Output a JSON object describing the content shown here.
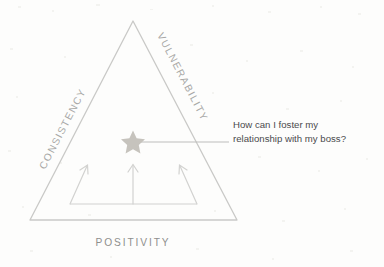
{
  "figure": {
    "title_visible": false,
    "colors": {
      "background": "#fdfdfc",
      "triangle_stroke": "#c9c9c7",
      "arrow_stroke": "#d2d2d0",
      "star_fill": "#c6c3bd",
      "leader_line": "#bdbdbb",
      "edge_label_text": "#a8a8a6",
      "base_label_text": "#8f8f8d",
      "annotation_text": "#4a4a4c"
    },
    "triangle": {
      "apex": [
        133,
        21
      ],
      "bottom_left": [
        30,
        220
      ],
      "bottom_right": [
        237,
        220
      ]
    },
    "labels": {
      "left_edge": "CONSISTENCY",
      "right_edge": "VULNERABILITY",
      "base": "POSITIVITY"
    },
    "marker": {
      "name": "star",
      "points": 5,
      "center": [
        133,
        142
      ]
    },
    "leader_line": {
      "from": [
        140,
        142
      ],
      "to": [
        229,
        142
      ]
    },
    "arrows": [
      {
        "name": "left-arrow",
        "from": [
          70,
          204
        ],
        "to": [
          87,
          166
        ],
        "direction": "up-right"
      },
      {
        "name": "center-arrow",
        "from": [
          133,
          204
        ],
        "to": [
          133,
          165
        ],
        "direction": "up"
      },
      {
        "name": "right-arrow",
        "from": [
          197,
          204
        ],
        "to": [
          180,
          166
        ],
        "direction": "up-left"
      }
    ],
    "arrow_baseline": {
      "from": [
        70,
        204
      ],
      "to": [
        197,
        204
      ]
    },
    "annotation": {
      "line1": "How can I foster my",
      "line2": "relationship with my boss?"
    }
  }
}
